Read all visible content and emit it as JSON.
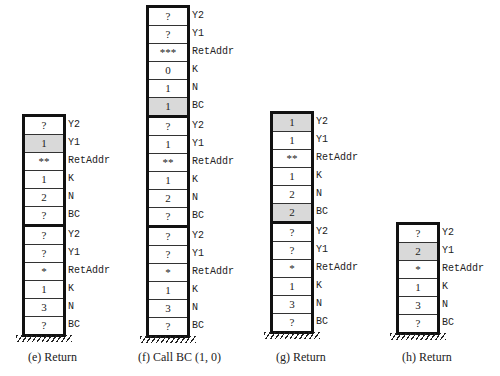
{
  "figure": {
    "stacks": [
      {
        "id": "e",
        "caption": "(e)  Return",
        "frames": [
          [
            {
              "value": "?",
              "label": "Y2",
              "highlight": false
            },
            {
              "value": "1",
              "label": "Y1",
              "highlight": true
            },
            {
              "value": "**",
              "label": "RetAddr",
              "highlight": false
            },
            {
              "value": "1",
              "label": "K",
              "highlight": false
            },
            {
              "value": "2",
              "label": "N",
              "highlight": false
            },
            {
              "value": "?",
              "label": "BC",
              "highlight": false
            }
          ],
          [
            {
              "value": "?",
              "label": "Y2",
              "highlight": false
            },
            {
              "value": "?",
              "label": "Y1",
              "highlight": false
            },
            {
              "value": "*",
              "label": "RetAddr",
              "highlight": false
            },
            {
              "value": "1",
              "label": "K",
              "highlight": false
            },
            {
              "value": "3",
              "label": "N",
              "highlight": false
            },
            {
              "value": "?",
              "label": "BC",
              "highlight": false
            }
          ]
        ]
      },
      {
        "id": "f",
        "caption": "(f)  Call BC (1, 0)",
        "frames": [
          [
            {
              "value": "?",
              "label": "Y2",
              "highlight": false
            },
            {
              "value": "?",
              "label": "Y1",
              "highlight": false
            },
            {
              "value": "***",
              "label": "RetAddr",
              "highlight": false
            },
            {
              "value": "0",
              "label": "K",
              "highlight": false
            },
            {
              "value": "1",
              "label": "N",
              "highlight": false
            },
            {
              "value": "1",
              "label": "BC",
              "highlight": true
            }
          ],
          [
            {
              "value": "?",
              "label": "Y2",
              "highlight": false
            },
            {
              "value": "1",
              "label": "Y1",
              "highlight": false
            },
            {
              "value": "**",
              "label": "RetAddr",
              "highlight": false
            },
            {
              "value": "1",
              "label": "K",
              "highlight": false
            },
            {
              "value": "2",
              "label": "N",
              "highlight": false
            },
            {
              "value": "?",
              "label": "BC",
              "highlight": false
            }
          ],
          [
            {
              "value": "?",
              "label": "Y2",
              "highlight": false
            },
            {
              "value": "?",
              "label": "Y1",
              "highlight": false
            },
            {
              "value": "*",
              "label": "RetAddr",
              "highlight": false
            },
            {
              "value": "1",
              "label": "K",
              "highlight": false
            },
            {
              "value": "3",
              "label": "N",
              "highlight": false
            },
            {
              "value": "?",
              "label": "BC",
              "highlight": false
            }
          ]
        ]
      },
      {
        "id": "g",
        "caption": "(g)  Return",
        "frames": [
          [
            {
              "value": "1",
              "label": "Y2",
              "highlight": true
            },
            {
              "value": "1",
              "label": "Y1",
              "highlight": false
            },
            {
              "value": "**",
              "label": "RetAddr",
              "highlight": false
            },
            {
              "value": "1",
              "label": "K",
              "highlight": false
            },
            {
              "value": "2",
              "label": "N",
              "highlight": false
            },
            {
              "value": "2",
              "label": "BC",
              "highlight": true
            }
          ],
          [
            {
              "value": "?",
              "label": "Y2",
              "highlight": false
            },
            {
              "value": "?",
              "label": "Y1",
              "highlight": false
            },
            {
              "value": "*",
              "label": "RetAddr",
              "highlight": false
            },
            {
              "value": "1",
              "label": "K",
              "highlight": false
            },
            {
              "value": "3",
              "label": "N",
              "highlight": false
            },
            {
              "value": "?",
              "label": "BC",
              "highlight": false
            }
          ]
        ]
      },
      {
        "id": "h",
        "caption": "(h)  Return",
        "frames": [
          [
            {
              "value": "?",
              "label": "Y2",
              "highlight": false
            },
            {
              "value": "2",
              "label": "Y1",
              "highlight": true
            },
            {
              "value": "*",
              "label": "RetAddr",
              "highlight": false
            },
            {
              "value": "1",
              "label": "K",
              "highlight": false
            },
            {
              "value": "3",
              "label": "N",
              "highlight": false
            },
            {
              "value": "?",
              "label": "BC",
              "highlight": false
            }
          ]
        ]
      }
    ],
    "colors": {
      "highlight": "#d9d9d9",
      "border": "#111111"
    }
  }
}
